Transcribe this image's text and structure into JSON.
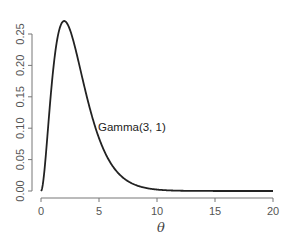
{
  "chart_data": {
    "type": "line",
    "title": "",
    "xlabel": "θ",
    "ylabel": "",
    "xlim": [
      0,
      20
    ],
    "ylim": [
      0,
      0.27
    ],
    "grid": false,
    "legend": null,
    "x_ticks": [
      "0",
      "5",
      "10",
      "15",
      "20"
    ],
    "y_ticks": [
      "0.00",
      "0.05",
      "0.10",
      "0.15",
      "0.20",
      "0.25"
    ],
    "annotations": [
      {
        "text": "Gamma(3, 1)",
        "x": 5,
        "y": 0.1
      }
    ],
    "series": [
      {
        "name": "Gamma(3, 1)",
        "x": [
          0,
          0.5,
          1,
          1.5,
          2,
          2.5,
          3,
          3.5,
          4,
          4.5,
          5,
          6,
          7,
          8,
          9,
          10,
          12,
          14,
          16,
          18,
          20
        ],
        "values": [
          0,
          0.0758,
          0.1839,
          0.251,
          0.2707,
          0.2565,
          0.224,
          0.185,
          0.1465,
          0.1125,
          0.0842,
          0.0446,
          0.0223,
          0.0107,
          0.005,
          0.0023,
          0.0004,
          0.0001,
          0,
          0,
          0
        ]
      }
    ],
    "line_color": "#222222"
  }
}
